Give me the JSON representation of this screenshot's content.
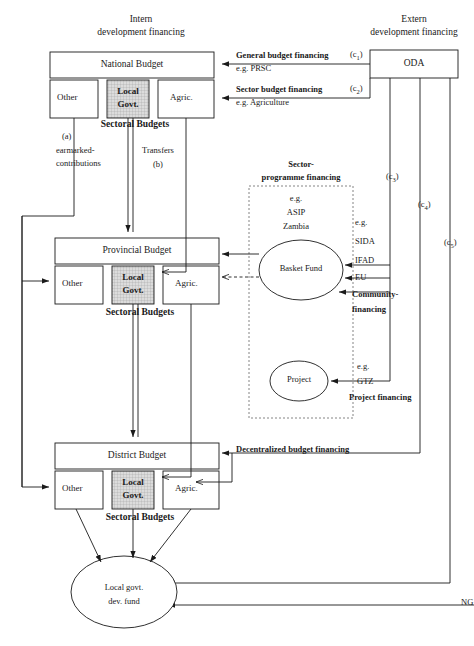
{
  "diagram": {
    "headers": {
      "left_line1": "Intern",
      "left_line2": "development financing",
      "right_line1": "Extern",
      "right_line2": "development financing"
    },
    "budgets": [
      {
        "id": "national",
        "title": "National Budget",
        "sub_boxes": [
          "Other",
          "Local Govt.",
          "Agric."
        ],
        "caption": "Sectoral Budgets"
      },
      {
        "id": "provincial",
        "title": "Provincial Budget",
        "sub_boxes": [
          "Other",
          "Local Govt.",
          "Agric."
        ],
        "caption": "Sectoral Budgets"
      },
      {
        "id": "district",
        "title": "District Budget",
        "sub_boxes": [
          "Other",
          "Local Govt.",
          "Agric."
        ],
        "caption": "Sectoral Budgets"
      }
    ],
    "oda": {
      "label": "ODA"
    },
    "fund": {
      "line1": "Local govt.",
      "line2": "dev. fund"
    },
    "basket_fund": {
      "label": "Basket Fund"
    },
    "project": {
      "label": "Project"
    },
    "sector_programme": {
      "title_line1": "Sector-",
      "title_line2": "programme financing",
      "eg": "e.g.",
      "items": [
        "ASIP",
        "Zambia"
      ]
    },
    "internal_flows": [
      {
        "code": "(a)",
        "label_line1": "earmarked-",
        "label_line2": "contributions"
      },
      {
        "label": "Transfers",
        "code": "(b)"
      }
    ],
    "external_flows": [
      {
        "code": "(c₁)",
        "label": "General budget financing",
        "example": "e.g. PRSC"
      },
      {
        "code": "(c₂)",
        "label": "Sector budget financing",
        "example": "e.g. Agriculture"
      },
      {
        "code": "(c₃)",
        "label": "Community-financing",
        "example": "e.g.",
        "donors": [
          "SIDA",
          "IFAD",
          "EU"
        ]
      },
      {
        "code": "(c₄)",
        "label": "Decentralized budget financing",
        "example": ""
      },
      {
        "code": "(c₅)",
        "label": "Project financing",
        "example": "e.g.",
        "donors": [
          "GTZ"
        ]
      }
    ],
    "ngo_label": "NG",
    "colors": {
      "line": "#1a1a1a",
      "local_govt_fill": "#d6d6d6",
      "background": "#ffffff"
    }
  }
}
